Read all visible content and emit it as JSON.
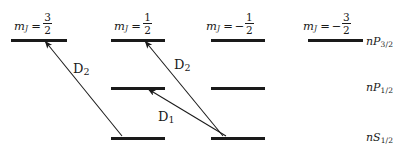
{
  "figure": {
    "type": "atomic-energy-level-diagram",
    "width": 405,
    "height": 152,
    "background": "#ffffff",
    "ink": "#1a1a1a"
  },
  "columns": [
    {
      "id": "col-mj-3-2",
      "mj_symbol": "m",
      "mj_subscript": "J",
      "mj_equals": "=",
      "mj_sign": "",
      "mj_numerator": "3",
      "mj_denominator": "2",
      "label_x": 14,
      "label_y": 12,
      "line_x": 11,
      "line_width": 56
    },
    {
      "id": "col-mj-1-2",
      "mj_symbol": "m",
      "mj_subscript": "J",
      "mj_equals": "=",
      "mj_sign": "",
      "mj_numerator": "1",
      "mj_denominator": "2",
      "label_x": 114,
      "label_y": 12,
      "line_x": 111,
      "line_width": 54
    },
    {
      "id": "col-mj-minus-1-2",
      "mj_symbol": "m",
      "mj_subscript": "J",
      "mj_equals": "=",
      "mj_sign": "−",
      "mj_numerator": "1",
      "mj_denominator": "2",
      "label_x": 206,
      "label_y": 12,
      "line_x": 211,
      "line_width": 54
    },
    {
      "id": "col-mj-minus-3-2",
      "mj_symbol": "m",
      "mj_subscript": "J",
      "mj_equals": "=",
      "mj_sign": "−",
      "mj_numerator": "3",
      "mj_denominator": "2",
      "label_x": 303,
      "label_y": 12,
      "line_x": 308,
      "line_width": 55
    }
  ],
  "rows": [
    {
      "id": "row-nP32",
      "term_n": "n",
      "term_L": "P",
      "term_sub": "3/2",
      "y": 39,
      "label_x": 366,
      "label_y": 36,
      "columns_present": [
        0,
        1,
        2,
        3
      ]
    },
    {
      "id": "row-nP12",
      "term_n": "n",
      "term_L": "P",
      "term_sub": "1/2",
      "y": 87,
      "label_x": 366,
      "label_y": 82,
      "columns_present": [
        1,
        2
      ]
    },
    {
      "id": "row-nS12",
      "term_n": "n",
      "term_L": "S",
      "term_sub": "1/2",
      "y": 137,
      "label_x": 366,
      "label_y": 132,
      "columns_present": [
        1,
        2
      ]
    }
  ],
  "transitions": [
    {
      "id": "transition-d2-left",
      "label_text": "D",
      "label_sub": "2",
      "label_x": 73,
      "label_y": 62,
      "from_x": 122,
      "from_y": 136,
      "to_x": 45,
      "to_y": 41,
      "from_level": "nS1/2 (mJ = 1/2)",
      "to_level": "nP3/2 (mJ = 3/2)"
    },
    {
      "id": "transition-d2-right",
      "label_text": "D",
      "label_sub": "2",
      "label_x": 174,
      "label_y": 58,
      "from_x": 223,
      "from_y": 136,
      "to_x": 145,
      "to_y": 41,
      "from_level": "nS1/2 (mJ = -1/2)",
      "to_level": "nP3/2 (mJ = 1/2)"
    },
    {
      "id": "transition-d1",
      "label_text": "D",
      "label_sub": "1",
      "label_x": 158,
      "label_y": 110,
      "from_x": 226,
      "from_y": 136,
      "to_x": 148,
      "to_y": 89,
      "from_level": "nS1/2 (mJ = -1/2)",
      "to_level": "nP1/2 (mJ = 1/2)"
    }
  ],
  "chart_data": {
    "type": "diagram",
    "title": "",
    "levels": [
      {
        "term": "nP3/2",
        "mJ": [
          "3/2",
          "1/2",
          "-1/2",
          "-3/2"
        ],
        "relative_energy": 1.0
      },
      {
        "term": "nP1/2",
        "mJ": [
          "1/2",
          "-1/2"
        ],
        "relative_energy": 0.51
      },
      {
        "term": "nS1/2",
        "mJ": [
          "1/2",
          "-1/2"
        ],
        "relative_energy": 0.0
      }
    ],
    "transitions": [
      {
        "name": "D2",
        "from": "nS1/2 mJ=1/2",
        "to": "nP3/2 mJ=3/2"
      },
      {
        "name": "D2",
        "from": "nS1/2 mJ=-1/2",
        "to": "nP3/2 mJ=1/2"
      },
      {
        "name": "D1",
        "from": "nS1/2 mJ=-1/2",
        "to": "nP1/2 mJ=1/2"
      }
    ]
  }
}
